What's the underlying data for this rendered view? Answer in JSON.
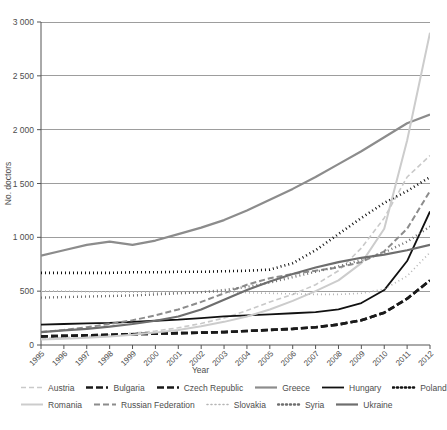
{
  "chart_data": {
    "type": "line",
    "title": "",
    "xlabel": "Year",
    "ylabel": "No. doctors",
    "xlim": [
      1995,
      2012
    ],
    "ylim": [
      0,
      3000
    ],
    "grid": true,
    "legend_position": "bottom",
    "x": [
      1995,
      1996,
      1997,
      1998,
      1999,
      2000,
      2001,
      2002,
      2003,
      2004,
      2005,
      2006,
      2007,
      2008,
      2009,
      2010,
      2011,
      2012
    ],
    "xtick_labels": [
      "1995",
      "1996",
      "1997",
      "1998",
      "1999",
      "2000",
      "2001",
      "2002",
      "2003",
      "2004",
      "2005",
      "2006",
      "2007",
      "2008",
      "2009",
      "2010",
      "2011",
      "2012"
    ],
    "ytick_labels": [
      "0",
      "500",
      "1 000",
      "1 500",
      "2 000",
      "2 500",
      "3 000"
    ],
    "ytick_values": [
      0,
      500,
      1000,
      1500,
      2000,
      2500,
      3000
    ],
    "series": [
      {
        "name": "Austria",
        "color": "#c9c9c9",
        "width": 1.6,
        "dash": "5,3",
        "values": [
          60,
          70,
          80,
          95,
          110,
          130,
          160,
          200,
          250,
          320,
          400,
          470,
          560,
          690,
          900,
          1180,
          1560,
          1760
        ]
      },
      {
        "name": "Bulgaria",
        "color": "#1a1a1a",
        "width": 2.6,
        "dash": "7,3",
        "values": [
          80,
          85,
          90,
          95,
          100,
          105,
          110,
          115,
          120,
          130,
          140,
          150,
          165,
          190,
          230,
          300,
          430,
          600
        ]
      },
      {
        "name": "Czech Republic",
        "color": "#1a1a1a",
        "width": 2.6,
        "dash": "7,3",
        "values": [
          80,
          85,
          90,
          95,
          100,
          105,
          110,
          115,
          120,
          130,
          140,
          150,
          165,
          190,
          230,
          300,
          430,
          600
        ]
      },
      {
        "name": "Greece",
        "color": "#8c8c8c",
        "width": 2.2,
        "dash": "none",
        "values": [
          830,
          880,
          930,
          960,
          930,
          970,
          1030,
          1090,
          1160,
          1250,
          1350,
          1450,
          1560,
          1680,
          1800,
          1930,
          2060,
          2140
        ]
      },
      {
        "name": "Hungary",
        "color": "#111111",
        "width": 1.8,
        "dash": "none",
        "values": [
          190,
          195,
          200,
          205,
          215,
          225,
          235,
          250,
          265,
          275,
          285,
          295,
          305,
          330,
          390,
          510,
          780,
          1240
        ]
      },
      {
        "name": "Poland",
        "color": "#111111",
        "width": 2.6,
        "dash": "1,3",
        "values": [
          670,
          670,
          670,
          670,
          675,
          675,
          680,
          680,
          685,
          690,
          700,
          760,
          880,
          1030,
          1180,
          1320,
          1430,
          1560
        ]
      },
      {
        "name": "Romania",
        "color": "#cccccc",
        "width": 2.0,
        "dash": "none",
        "values": [
          50,
          58,
          68,
          80,
          95,
          115,
          140,
          175,
          215,
          265,
          330,
          410,
          500,
          600,
          760,
          1080,
          1900,
          2900
        ]
      },
      {
        "name": "Russian Federation",
        "color": "#8c8c8c",
        "width": 2.0,
        "dash": "6,3",
        "values": [
          120,
          140,
          165,
          195,
          230,
          275,
          330,
          400,
          480,
          560,
          620,
          660,
          690,
          720,
          770,
          870,
          1080,
          1430
        ]
      },
      {
        "name": "Slovakia",
        "color": "#b5b5b5",
        "width": 1.6,
        "dash": "1,3",
        "values": [
          500,
          500,
          495,
          495,
          490,
          490,
          490,
          490,
          490,
          485,
          480,
          475,
          470,
          470,
          480,
          520,
          640,
          860
        ]
      },
      {
        "name": "Syria",
        "color": "#6e6e6e",
        "width": 2.4,
        "dash": "1,3",
        "values": [
          440,
          445,
          450,
          455,
          460,
          470,
          480,
          490,
          510,
          540,
          580,
          630,
          680,
          730,
          790,
          860,
          960,
          1100
        ]
      },
      {
        "name": "Ukraine",
        "color": "#6e6e6e",
        "width": 2.2,
        "dash": "none",
        "values": [
          120,
          135,
          150,
          170,
          195,
          225,
          265,
          330,
          420,
          510,
          590,
          660,
          720,
          770,
          810,
          840,
          880,
          930
        ]
      }
    ]
  }
}
